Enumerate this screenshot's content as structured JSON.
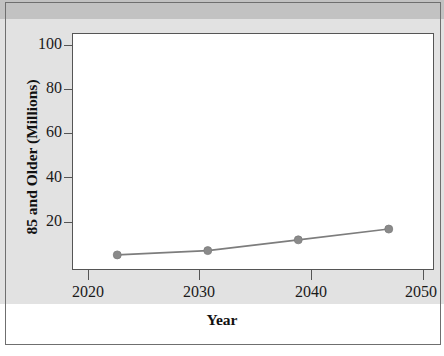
{
  "figure": {
    "background_top_band": "#c2c2c2",
    "background_backdrop": "#e2e2e2",
    "plot_background": "#ffffff",
    "frame_color": "#6f6f6f"
  },
  "chart_data": {
    "type": "line",
    "title": "",
    "subtitle": "",
    "xlabel": "Year",
    "ylabel": "85 and Older (Millions)",
    "x": [
      2020,
      2030,
      2040,
      2050
    ],
    "categories": [
      "2020",
      "2030",
      "2040",
      "2050"
    ],
    "values": [
      7,
      9,
      14,
      19
    ],
    "series": [
      {
        "name": "85 and Older",
        "values": [
          7,
          9,
          14,
          19
        ],
        "color": "#7d7d7d",
        "marker": "circle",
        "marker_color": "#8a8a8a"
      }
    ],
    "xlim": [
      2015,
      2055
    ],
    "ylim": [
      0,
      110
    ],
    "yticks": [
      20,
      40,
      60,
      80,
      100
    ],
    "ytick_labels": [
      "20",
      "40",
      "60",
      "80",
      "100"
    ],
    "xticks": [
      2020,
      2030,
      2040,
      2050
    ],
    "xtick_labels": [
      "2020",
      "2030",
      "2040",
      "2050"
    ],
    "grid": false,
    "legend": false,
    "legend_position": "none",
    "annotations": []
  }
}
